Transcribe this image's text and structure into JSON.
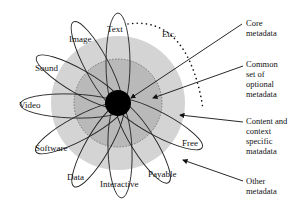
{
  "diagram": {
    "petals": [
      {
        "label": "Text",
        "angle": -90,
        "lx": 139,
        "ly": 32
      },
      {
        "label": "Image",
        "angle": -117,
        "lx": 92,
        "ly": 42
      },
      {
        "label": "Sound",
        "angle": -150,
        "lx": 52,
        "ly": 70
      },
      {
        "label": "Video",
        "angle": 180,
        "lx": 28,
        "ly": 107
      },
      {
        "label": "Software",
        "angle": 150,
        "lx": 45,
        "ly": 150
      },
      {
        "label": "Data",
        "angle": 115,
        "lx": 78,
        "ly": 179
      },
      {
        "label": "Interactive",
        "angle": 85,
        "lx": 125,
        "ly": 186
      },
      {
        "label": "Payable",
        "angle": 55,
        "lx": 178,
        "ly": 176
      },
      {
        "label": "Free",
        "angle": 25,
        "lx": 196,
        "ly": 144
      }
    ],
    "etc_label": "Etc.",
    "annotations": [
      {
        "line1": "Core",
        "line2": "metadata",
        "line3": "",
        "line4": ""
      },
      {
        "line1": "Common",
        "line2": "set of",
        "line3": "optional",
        "line4": "metadata"
      },
      {
        "line1": "Content and",
        "line2": "context",
        "line3": "specific",
        "line4": "matadata"
      },
      {
        "line1": "Other",
        "line2": "metadata",
        "line3": "",
        "line4": ""
      }
    ],
    "colors": {
      "outer_ring": "#d4d4d4",
      "inner_ring": "#b9b9b9",
      "core": "#000000",
      "line": "#222222"
    }
  }
}
